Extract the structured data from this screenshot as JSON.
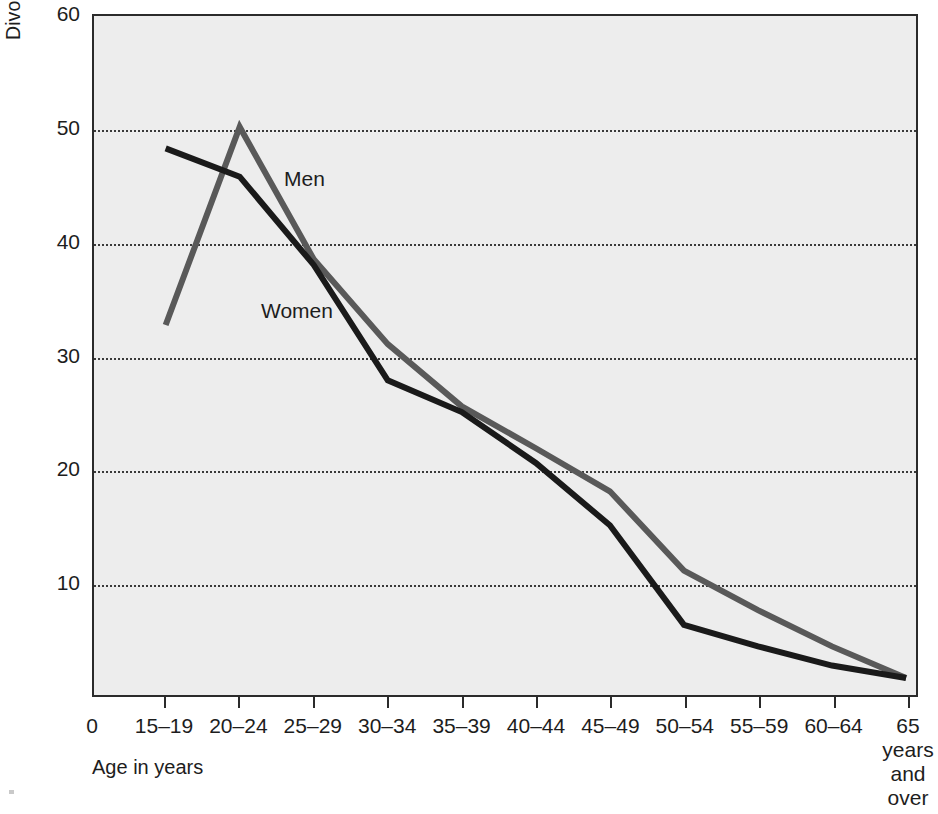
{
  "chart_data": {
    "type": "line",
    "title": "",
    "xlabel": "Age in years",
    "ylabel": "Divorces per 1,000 married population",
    "categories": [
      "15–19",
      "20–24",
      "25–29",
      "30–34",
      "35–39",
      "40–44",
      "45–49",
      "50–54",
      "55–59",
      "60–64",
      "65 years and over"
    ],
    "x_tick_labels": [
      "15–19",
      "20–24",
      "25–29",
      "30–34",
      "35–39",
      "40–44",
      "45–49",
      "50–54",
      "55–59",
      "60–64",
      "65"
    ],
    "x_last_label_extra_lines": [
      "years",
      "and",
      "over"
    ],
    "x_origin_label": "0",
    "ylim": [
      0,
      60
    ],
    "y_ticks": [
      10,
      20,
      30,
      40,
      50,
      60
    ],
    "y_tick_labels": [
      "10",
      "20",
      "30",
      "40",
      "50",
      "60"
    ],
    "gridlines": [
      10,
      20,
      30,
      40,
      50
    ],
    "grid": true,
    "legend_position": "inline-annotation",
    "series": [
      {
        "name": "Men",
        "color": "#595959",
        "values": [
          32.7,
          50.2,
          38.5,
          31.0,
          25.5,
          21.8,
          18.0,
          11.0,
          7.5,
          4.3,
          1.5
        ]
      },
      {
        "name": "Women",
        "color": "#1a1a1a",
        "values": [
          48.3,
          45.8,
          38.0,
          27.8,
          25.0,
          20.5,
          15.0,
          6.2,
          4.3,
          2.6,
          1.5
        ]
      }
    ],
    "annotations": [
      {
        "text": "Men",
        "x_category": "25–29",
        "y": 44.0
      },
      {
        "text": "Women",
        "x_category": "25–29",
        "y": 32.5
      }
    ]
  },
  "colors": {
    "plot_background": "#ededed",
    "page_background": "#ffffff",
    "axis": "#2b2b2b",
    "gridline": "#3a3a3a",
    "text": "#1d1d1d",
    "men_line": "#595959",
    "women_line": "#1a1a1a"
  }
}
